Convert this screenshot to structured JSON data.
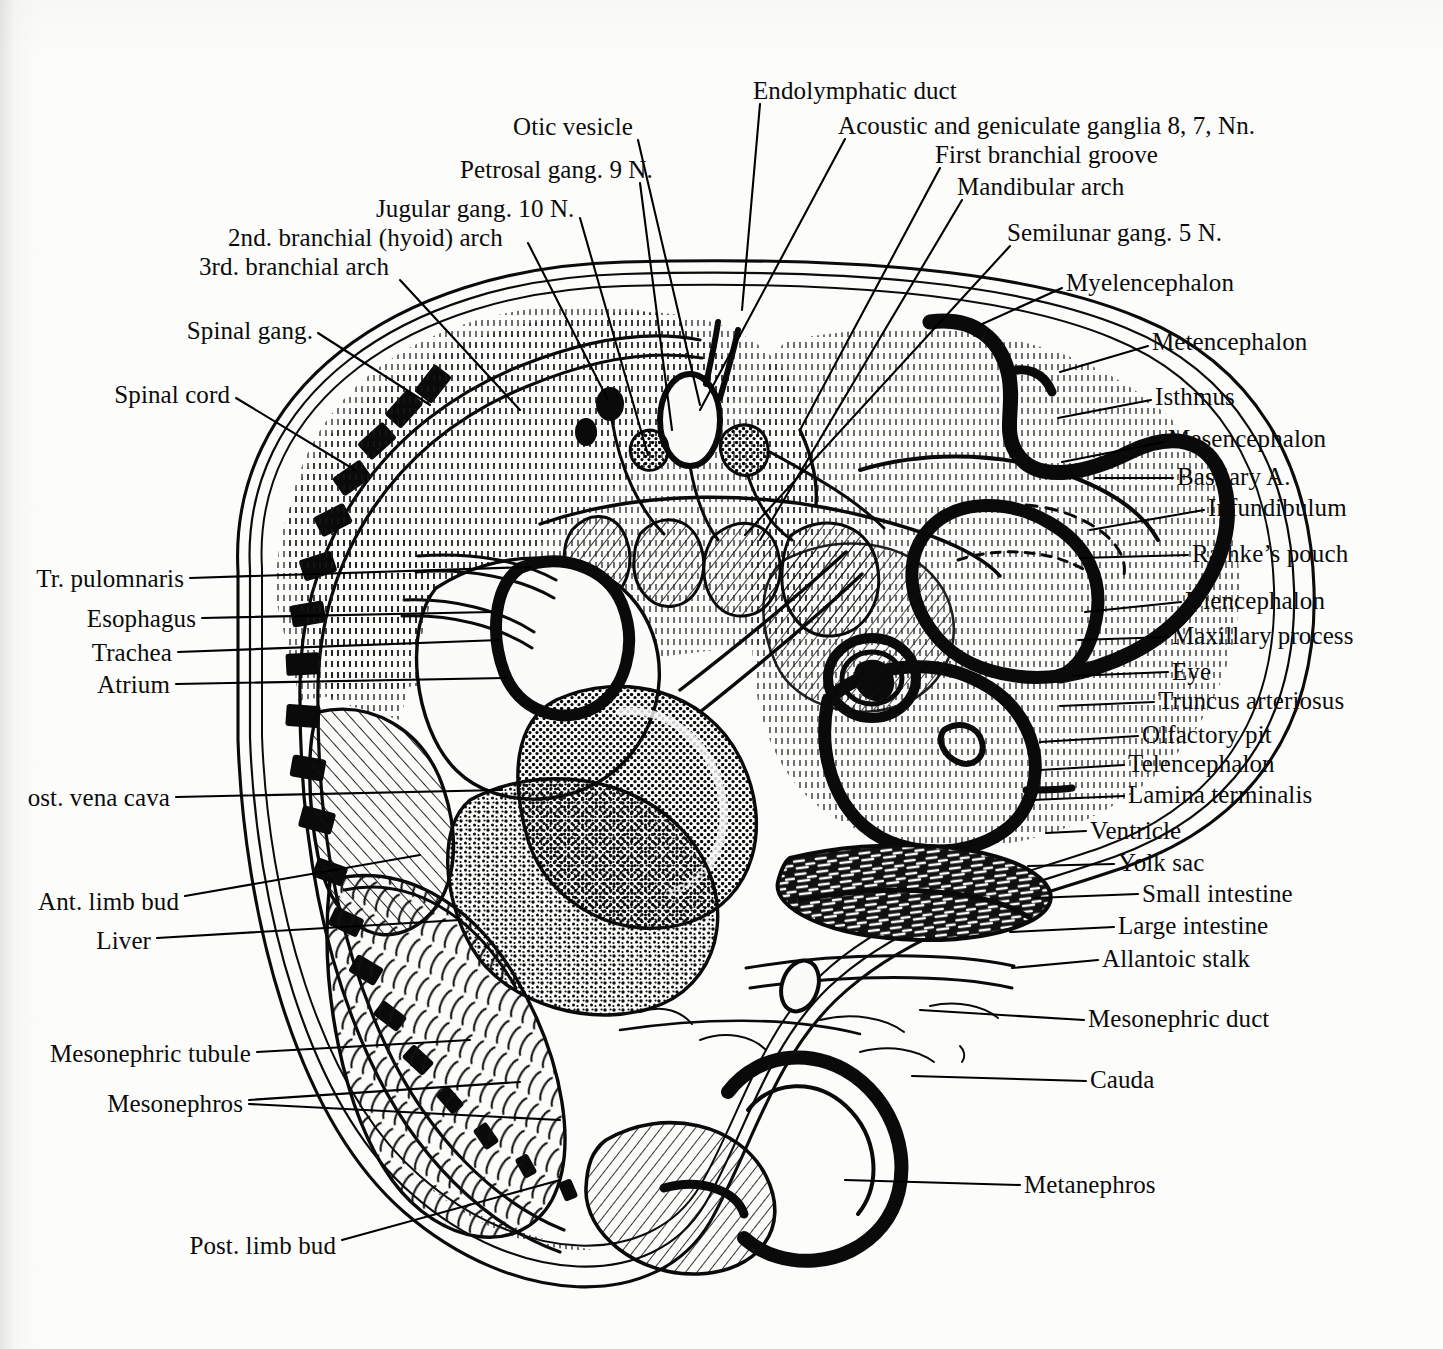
{
  "figure": {
    "medium": "ink line engraving",
    "background_color": "#fcfcfb",
    "ink_color": "#000000"
  },
  "labels": {
    "top": [
      {
        "id": "endolymphatic-duct",
        "text": "Endolymphatic duct",
        "x": 753,
        "y": 90,
        "align": "left",
        "leader": "M 760,104 L 742,310"
      },
      {
        "id": "otic-vesicle",
        "text": "Otic vesicle",
        "x": 513,
        "y": 126,
        "align": "left",
        "leader": "M 638,140 L 700,405"
      },
      {
        "id": "acoustic-geniculate-ganglia",
        "text": "Acoustic and geniculate ganglia 8, 7, Nn.",
        "x": 838,
        "y": 125,
        "align": "left",
        "leader": "M 845,139 L 700,410"
      },
      {
        "id": "petrosal-gang-9n",
        "text": "Petrosal gang. 9 N.",
        "x": 460,
        "y": 169,
        "align": "left",
        "leader": "M 640,183 L 672,430"
      },
      {
        "id": "first-branchial-groove",
        "text": "First branchial groove",
        "x": 935,
        "y": 154,
        "align": "left",
        "leader": "M 940,168 L 800,430"
      },
      {
        "id": "jugular-gang-10n",
        "text": "Jugular gang. 10 N.",
        "x": 376,
        "y": 208,
        "align": "left",
        "leader": "M 580,218 L 648,455"
      },
      {
        "id": "mandibular-arch",
        "text": "Mandibular arch",
        "x": 957,
        "y": 186,
        "align": "left",
        "leader": "M 962,200 L 760,540"
      },
      {
        "id": "second-branchial-hyoid-arch",
        "text": "2nd. branchial (hyoid) arch",
        "x": 228,
        "y": 237,
        "align": "left",
        "leader": "M 528,243 L 608,400"
      },
      {
        "id": "semilunar-gang-5n",
        "text": "Semilunar gang. 5 N.",
        "x": 1007,
        "y": 232,
        "align": "left",
        "leader": "M 1010,246 L 745,535"
      },
      {
        "id": "third-branchial-arch",
        "text": "3rd. branchial arch",
        "x": 199,
        "y": 266,
        "align": "left",
        "leader": "M 400,280 L 520,410"
      }
    ],
    "left": [
      {
        "id": "spinal-gang",
        "text": "Spinal gang.",
        "x": 313,
        "y": 330,
        "align": "right",
        "leader": "M 318,333 L 430,405"
      },
      {
        "id": "spinal-cord",
        "text": "Spinal cord",
        "x": 230,
        "y": 394,
        "align": "right",
        "leader": "M 236,398 L 355,470"
      },
      {
        "id": "tr-pulomnaris",
        "text": "Tr. pulomnaris",
        "x": 184,
        "y": 578,
        "align": "right",
        "leader": "M 190,578 L 530,567"
      },
      {
        "id": "esophagus",
        "text": "Esophagus",
        "x": 196,
        "y": 618,
        "align": "right",
        "leader": "M 202,618 L 492,612"
      },
      {
        "id": "trachea",
        "text": "Trachea",
        "x": 172,
        "y": 652,
        "align": "right",
        "leader": "M 178,652 L 500,640"
      },
      {
        "id": "atrium",
        "text": "Atrium",
        "x": 170,
        "y": 684,
        "align": "right",
        "leader": "M 176,684 L 505,678"
      },
      {
        "id": "post-vena-cava",
        "text": "ost. vena cava",
        "x": 170,
        "y": 797,
        "align": "right",
        "leader": "M 176,797 L 502,790"
      },
      {
        "id": "ant-limb-bud",
        "text": "Ant. limb bud",
        "x": 179,
        "y": 901,
        "align": "right",
        "leader": "M 185,896 L 420,855"
      },
      {
        "id": "liver",
        "text": "Liver",
        "x": 151,
        "y": 940,
        "align": "right",
        "leader": "M 157,938 L 460,920"
      },
      {
        "id": "mesonephric-tubule",
        "text": "Mesonephric tubule",
        "x": 251,
        "y": 1053,
        "align": "right",
        "leader": "M 257,1052 L 470,1040"
      },
      {
        "id": "mesonephros",
        "text": "Mesonephros",
        "x": 243,
        "y": 1103,
        "align": "right",
        "leader": "M 249,1100 L 520,1082"
      },
      {
        "id": "mesonephros-2",
        "text": "",
        "x": 243,
        "y": 1103,
        "align": "right",
        "leader": "M 249,1104 L 560,1120"
      },
      {
        "id": "post-limb-bud",
        "text": "Post. limb bud",
        "x": 336,
        "y": 1245,
        "align": "right",
        "leader": "M 342,1240 L 560,1180"
      }
    ],
    "right": [
      {
        "id": "myelencephalon",
        "text": "Myelencephalon",
        "x": 1066,
        "y": 282,
        "align": "left",
        "leader": "M 1062,288 L 980,325"
      },
      {
        "id": "metencephalon",
        "text": "Metencephalon",
        "x": 1152,
        "y": 341,
        "align": "left",
        "leader": "M 1148,346 L 1060,372"
      },
      {
        "id": "isthmus",
        "text": "Isthmus",
        "x": 1155,
        "y": 396,
        "align": "left",
        "leader": "M 1151,400 L 1058,418"
      },
      {
        "id": "mesencephalon",
        "text": "Mesencephalon",
        "x": 1168,
        "y": 438,
        "align": "left",
        "leader": "M 1164,442 L 1062,462"
      },
      {
        "id": "basilary-a",
        "text": "Basilary A.",
        "x": 1177,
        "y": 476,
        "align": "left",
        "leader": "M 1173,478 L 1095,478"
      },
      {
        "id": "infundibulum",
        "text": "Infundibulum",
        "x": 1208,
        "y": 507,
        "align": "left",
        "leader": "M 1204,510 L 1090,530"
      },
      {
        "id": "rathkes-pouch",
        "text": "Rathke’s pouch",
        "x": 1192,
        "y": 553,
        "align": "left",
        "leader": "M 1188,555 L 1080,558"
      },
      {
        "id": "diencephalon",
        "text": "Diencephalon",
        "x": 1185,
        "y": 600,
        "align": "left",
        "leader": "M 1181,602 L 1085,612"
      },
      {
        "id": "maxillary-process",
        "text": "Maxillary process",
        "x": 1172,
        "y": 635,
        "align": "left",
        "leader": "M 1168,637 L 1078,640"
      },
      {
        "id": "eye",
        "text": "Eye",
        "x": 1172,
        "y": 671,
        "align": "left",
        "leader": "M 1168,672 L 1072,676"
      },
      {
        "id": "truncus-arteriosus",
        "text": "Truncus arteriosus",
        "x": 1158,
        "y": 700,
        "align": "left",
        "leader": "M 1154,702 L 1060,706"
      },
      {
        "id": "olfactory-pit",
        "text": "Olfactory pit",
        "x": 1142,
        "y": 734,
        "align": "left",
        "leader": "M 1138,736 L 1040,742"
      },
      {
        "id": "telencephalon",
        "text": "Telencephalon",
        "x": 1128,
        "y": 763,
        "align": "left",
        "leader": "M 1124,765 L 1040,770"
      },
      {
        "id": "lamina-terminalis",
        "text": "Lamina terminalis",
        "x": 1128,
        "y": 794,
        "align": "left",
        "leader": "M 1124,796 L 1032,800"
      },
      {
        "id": "ventricle",
        "text": "Ventricle",
        "x": 1090,
        "y": 830,
        "align": "left",
        "leader": "M 1086,831 L 1046,833"
      },
      {
        "id": "yolk-sac",
        "text": "Yolk sac",
        "x": 1118,
        "y": 862,
        "align": "left",
        "leader": "M 1114,864 L 1028,866"
      },
      {
        "id": "small-intestine",
        "text": "Small intestine",
        "x": 1142,
        "y": 893,
        "align": "left",
        "leader": "M 1138,894 L 1034,898"
      },
      {
        "id": "large-intestine",
        "text": "Large intestine",
        "x": 1118,
        "y": 925,
        "align": "left",
        "leader": "M 1114,927 L 1010,932"
      },
      {
        "id": "allantoic-stalk",
        "text": "Allantoic stalk",
        "x": 1102,
        "y": 958,
        "align": "left",
        "leader": "M 1098,960 L 1012,968"
      },
      {
        "id": "mesonephric-duct",
        "text": "Mesonephric duct",
        "x": 1088,
        "y": 1018,
        "align": "left",
        "leader": "M 1084,1020 L 920,1010"
      },
      {
        "id": "cauda",
        "text": "Cauda",
        "x": 1090,
        "y": 1079,
        "align": "left",
        "leader": "M 1086,1081 L 912,1076"
      },
      {
        "id": "metanephros",
        "text": "Metanephros",
        "x": 1024,
        "y": 1184,
        "align": "left",
        "leader": "M 1020,1185 L 845,1180"
      }
    ]
  }
}
